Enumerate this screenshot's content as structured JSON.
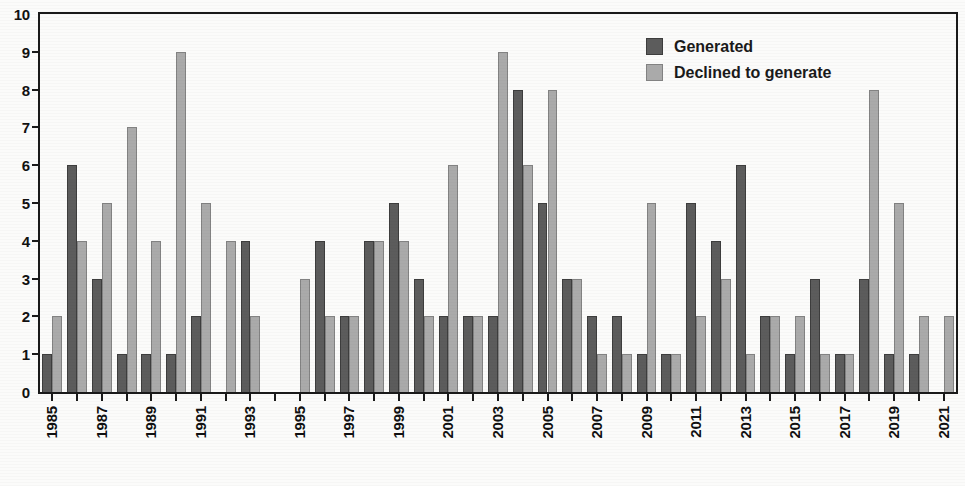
{
  "chart_data": {
    "type": "bar",
    "title": "",
    "xlabel": "",
    "ylabel": "",
    "ylim": [
      0,
      10
    ],
    "y_ticks": [
      0,
      1,
      2,
      3,
      4,
      5,
      6,
      7,
      8,
      9,
      10
    ],
    "grid": false,
    "legend_position": "top-right",
    "x_tick_step": 2,
    "categories": [
      "1985",
      "1986",
      "1987",
      "1988",
      "1989",
      "1990",
      "1991",
      "1992",
      "1993",
      "1994",
      "1995",
      "1996",
      "1997",
      "1998",
      "1999",
      "2000",
      "2001",
      "2002",
      "2003",
      "2004",
      "2005",
      "2006",
      "2007",
      "2008",
      "2009",
      "2010",
      "2011",
      "2012",
      "2013",
      "2014",
      "2015",
      "2016",
      "2017",
      "2018",
      "2019",
      "2020",
      "2021"
    ],
    "x_tick_labels": [
      "1985",
      "1987",
      "1989",
      "1991",
      "1993",
      "1995",
      "1997",
      "1999",
      "2001",
      "2003",
      "2005",
      "2007",
      "2009",
      "2011",
      "2013",
      "2015",
      "2017",
      "2019",
      "2021"
    ],
    "series": [
      {
        "name": "Generated",
        "color": "#5c5c5c",
        "values": [
          1,
          6,
          3,
          1,
          1,
          1,
          2,
          0,
          4,
          0,
          0,
          4,
          2,
          4,
          5,
          3,
          2,
          2,
          2,
          8,
          5,
          3,
          2,
          2,
          1,
          1,
          5,
          4,
          6,
          2,
          1,
          3,
          1,
          3,
          1,
          1,
          0
        ]
      },
      {
        "name": "Declined to generate",
        "color": "#aaaaaa",
        "values": [
          2,
          4,
          5,
          7,
          4,
          9,
          5,
          4,
          2,
          0,
          3,
          2,
          2,
          4,
          4,
          2,
          6,
          2,
          9,
          6,
          8,
          3,
          1,
          1,
          5,
          1,
          2,
          3,
          1,
          2,
          2,
          1,
          1,
          8,
          5,
          2,
          2
        ]
      }
    ]
  },
  "legend": {
    "items": [
      {
        "label": "Generated",
        "key": "generated"
      },
      {
        "label": "Declined to generate",
        "key": "declined"
      }
    ]
  }
}
